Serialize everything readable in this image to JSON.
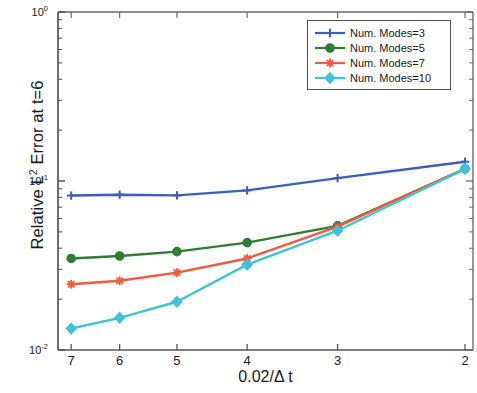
{
  "chart_data": {
    "type": "line",
    "title": "",
    "xlabel": "0.02/Δ t",
    "ylabel_parts": {
      "pre": "Relative L",
      "sup": "2",
      "post": " Error at t=6"
    },
    "ylabel": "Relative L2 Error at t=6",
    "xscale": "log",
    "yscale": "log",
    "xlim": [
      7.3,
      1.95
    ],
    "ylim": [
      0.01,
      1.0
    ],
    "x_inverted": true,
    "grid": false,
    "legend_position": "top-right",
    "xticks": [
      "7",
      "6",
      "5",
      "4",
      "3",
      "2"
    ],
    "xtick_values": [
      7,
      6,
      5,
      4,
      3,
      2
    ],
    "yticks": [
      "10^0",
      "10^-1",
      "10^-2"
    ],
    "ytick_exponents": [
      "0",
      "-1",
      "-2"
    ],
    "ytick_values": [
      1,
      0.1,
      0.01
    ],
    "x": [
      7,
      6,
      5,
      4,
      3,
      2
    ],
    "series": [
      {
        "name": "Num. Modes=3",
        "color": "#3b5fc0",
        "marker": "plus",
        "values": [
          0.082,
          0.083,
          0.0822,
          0.088,
          0.104,
          0.13
        ]
      },
      {
        "name": "Num. Modes=5",
        "color": "#2e7d32",
        "marker": "circle",
        "values": [
          0.0348,
          0.036,
          0.0382,
          0.0432,
          0.0543,
          0.118
        ]
      },
      {
        "name": "Num. Modes=7",
        "color": "#ef5b3c",
        "marker": "star",
        "values": [
          0.0245,
          0.0257,
          0.0287,
          0.0348,
          0.0537,
          0.118
        ]
      },
      {
        "name": "Num. Modes=10",
        "color": "#3fc3d6",
        "marker": "diamond",
        "values": [
          0.0134,
          0.0155,
          0.0193,
          0.032,
          0.0508,
          0.118
        ]
      }
    ]
  },
  "legend": {
    "entries": [
      {
        "label": "Num. Modes=3"
      },
      {
        "label": "Num. Modes=5"
      },
      {
        "label": "Num. Modes=7"
      },
      {
        "label": "Num. Modes=10"
      }
    ]
  }
}
